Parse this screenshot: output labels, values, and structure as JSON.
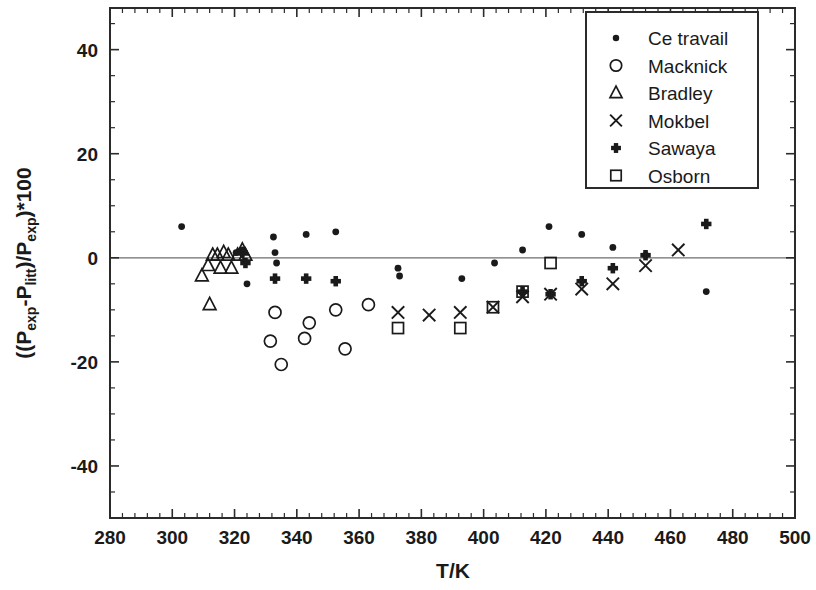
{
  "chart_data": {
    "type": "scatter",
    "title": "",
    "xlabel": "T/K",
    "ylabel": "((P_exp-P_litt)/P_exp)*100",
    "ylabel_parts": {
      "prefix": "((P",
      "sub1": "exp",
      "mid1": "-P",
      "sub2": "litt",
      "mid2": ")/P",
      "sub3": "exp",
      "suffix": ")*100"
    },
    "xlim": [
      280,
      500
    ],
    "ylim": [
      -50,
      48
    ],
    "x_major_ticks": [
      280,
      300,
      320,
      340,
      360,
      380,
      400,
      420,
      440,
      460,
      480,
      500
    ],
    "x_minor_step": 4,
    "y_major_ticks": [
      40,
      20,
      0,
      -20,
      -40
    ],
    "y_major_tick_labels": [
      "40",
      "20",
      "0",
      "-20",
      "-40"
    ],
    "y_minor_step": 5,
    "grid": false,
    "zero_reference_line": 0,
    "legend_position": "top-right",
    "series": [
      {
        "name": "Ce travail",
        "marker": "filled-circle",
        "points": [
          [
            303.0,
            6.0
          ],
          [
            320.5,
            1.0
          ],
          [
            322.5,
            1.5
          ],
          [
            324.0,
            -5.0
          ],
          [
            332.5,
            4.0
          ],
          [
            333.0,
            1.0
          ],
          [
            333.5,
            -1.0
          ],
          [
            343.0,
            4.5
          ],
          [
            352.5,
            5.0
          ],
          [
            372.5,
            -2.0
          ],
          [
            373.0,
            -3.5
          ],
          [
            393.0,
            -4.0
          ],
          [
            403.5,
            -1.0
          ],
          [
            412.5,
            1.5
          ],
          [
            421.0,
            6.0
          ],
          [
            431.5,
            4.5
          ],
          [
            441.5,
            2.0
          ],
          [
            452.0,
            0.5
          ],
          [
            471.5,
            -6.5
          ]
        ]
      },
      {
        "name": "Macknick",
        "marker": "open-circle",
        "points": [
          [
            333.0,
            -10.5
          ],
          [
            331.5,
            -16.0
          ],
          [
            335.0,
            -20.5
          ],
          [
            342.5,
            -15.5
          ],
          [
            344.0,
            -12.5
          ],
          [
            352.5,
            -10.0
          ],
          [
            355.5,
            -17.5
          ],
          [
            363.0,
            -9.0
          ]
        ]
      },
      {
        "name": "Bradley",
        "marker": "open-triangle",
        "points": [
          [
            309.5,
            -3.5
          ],
          [
            311.5,
            -1.5
          ],
          [
            313.0,
            0.5
          ],
          [
            314.5,
            0.5
          ],
          [
            315.5,
            -2.0
          ],
          [
            316.5,
            1.0
          ],
          [
            318.0,
            0.5
          ],
          [
            319.0,
            -2.0
          ],
          [
            321.0,
            0.5
          ],
          [
            322.5,
            1.5
          ],
          [
            323.5,
            0.5
          ],
          [
            312.0,
            -9.0
          ]
        ]
      },
      {
        "name": "Mokbel",
        "marker": "cross-x",
        "points": [
          [
            372.5,
            -10.5
          ],
          [
            382.5,
            -11.0
          ],
          [
            392.5,
            -10.5
          ],
          [
            403.0,
            -9.5
          ],
          [
            412.5,
            -7.5
          ],
          [
            421.5,
            -7.0
          ],
          [
            431.5,
            -6.0
          ],
          [
            441.5,
            -5.0
          ],
          [
            452.0,
            -1.5
          ],
          [
            462.5,
            1.5
          ]
        ]
      },
      {
        "name": "Sawaya",
        "marker": "filled-plus",
        "points": [
          [
            322.5,
            1.0
          ],
          [
            323.5,
            -1.0
          ],
          [
            333.0,
            -4.0
          ],
          [
            343.0,
            -4.0
          ],
          [
            352.5,
            -4.5
          ],
          [
            412.5,
            -6.5
          ],
          [
            421.5,
            -7.0
          ],
          [
            431.5,
            -4.5
          ],
          [
            441.5,
            -2.0
          ],
          [
            452.0,
            0.5
          ],
          [
            471.5,
            6.5
          ]
        ]
      },
      {
        "name": "Osborn",
        "marker": "open-square",
        "points": [
          [
            372.5,
            -13.5
          ],
          [
            392.5,
            -13.5
          ],
          [
            403.0,
            -9.5
          ],
          [
            412.5,
            -6.5
          ],
          [
            421.5,
            -1.0
          ]
        ]
      }
    ]
  },
  "legend": {
    "entries": [
      {
        "label": "Ce travail",
        "marker": "filled-circle"
      },
      {
        "label": "Macknick",
        "marker": "open-circle"
      },
      {
        "label": "Bradley",
        "marker": "open-triangle"
      },
      {
        "label": "Mokbel",
        "marker": "cross-x"
      },
      {
        "label": "Sawaya",
        "marker": "filled-plus"
      },
      {
        "label": "Osborn",
        "marker": "open-square"
      }
    ]
  },
  "colors": {
    "axis": "#2b2b2b",
    "marker": "#1a1a1a",
    "zero_line": "#6e6e6e",
    "background": "#ffffff"
  }
}
